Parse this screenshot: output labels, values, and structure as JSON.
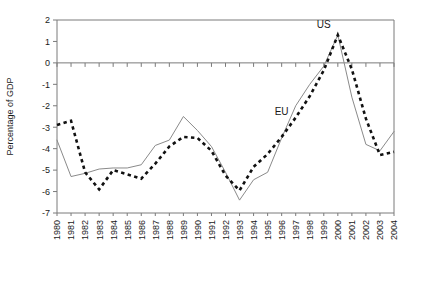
{
  "chart_data": {
    "type": "line",
    "title": "",
    "subtitle": "",
    "xlabel": "",
    "ylabel": "Percentage of GDP",
    "ylim": [
      -7,
      2
    ],
    "xlim": [
      1980,
      2004
    ],
    "yticks": [
      2,
      1,
      0,
      -1,
      -2,
      -3,
      -4,
      -5,
      -6,
      -7
    ],
    "ytick_labels": [
      "2",
      "1",
      "0",
      "-1",
      "-2",
      "-3",
      "-4",
      "-5",
      "-6",
      "-7"
    ],
    "grid": false,
    "zero_line": true,
    "legend_position": "inline-annotations",
    "categories": [
      "1980",
      "1981",
      "1982",
      "1983",
      "1984",
      "1985",
      "1986",
      "1987",
      "1988",
      "1989",
      "1990",
      "1991",
      "1992",
      "1993",
      "1994",
      "1995",
      "1996",
      "1997",
      "1998",
      "1999",
      "2000",
      "2001",
      "2002",
      "2003",
      "2004"
    ],
    "series": [
      {
        "name": "EU",
        "style": "solid-thin",
        "color": "#8a8a8a",
        "annotation": "EU",
        "annotation_x": "1996",
        "annotation_y": -2.45,
        "values": [
          -3.6,
          -5.3,
          -5.15,
          -4.95,
          -4.9,
          -4.9,
          -4.75,
          -3.85,
          -3.6,
          -2.5,
          -3.15,
          -3.9,
          -5.1,
          -6.4,
          -5.45,
          -5.1,
          -3.5,
          -2.0,
          -1.0,
          -0.15,
          1.3,
          -1.6,
          -3.8,
          -4.1,
          -3.2
        ]
      },
      {
        "name": "US",
        "style": "dashed-thick",
        "color": "#111111",
        "annotation": "US",
        "annotation_x": "1999",
        "annotation_y": 1.65,
        "values": [
          -2.9,
          -2.7,
          -5.1,
          -5.9,
          -5.0,
          -5.2,
          -5.4,
          -4.7,
          -3.9,
          -3.45,
          -3.5,
          -4.1,
          -5.25,
          -5.95,
          -4.85,
          -4.25,
          -3.45,
          -2.55,
          -1.55,
          -0.35,
          1.3,
          -0.3,
          -2.6,
          -4.3,
          -4.15
        ]
      }
    ]
  },
  "plot": {
    "left": 57,
    "top": 20,
    "right": 394,
    "bottom": 213
  }
}
